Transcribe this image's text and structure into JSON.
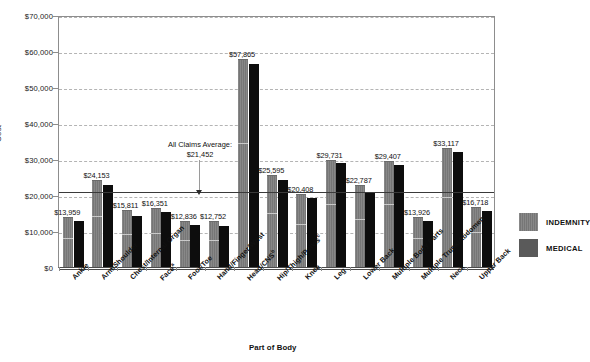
{
  "chart_data": {
    "type": "bar",
    "title": "",
    "xlabel": "Part of Body",
    "ylabel": "Cost",
    "ylim": [
      0,
      70000
    ],
    "ytick_labels": [
      "$0",
      "$10,000",
      "$20,000",
      "$30,000",
      "$40,000",
      "$50,000",
      "$60,000",
      "$70,000"
    ],
    "ytick_values": [
      0,
      10000,
      20000,
      30000,
      40000,
      50000,
      60000,
      70000
    ],
    "grid": "horizontal-dashed",
    "legend_position": "right",
    "categories": [
      "Ankle",
      "Arm/Shoulder",
      "Chest/Internal Organ",
      "Face",
      "Foot/Toe",
      "Hand/Finger/Wrist",
      "Head/CNS",
      "Hip/Thigh/Pelvis",
      "Knee",
      "Leg",
      "Lower Back",
      "Multiple Body Parts",
      "Multiple Trunk/Abdomen",
      "Neck",
      "Upper Back"
    ],
    "category_footnotes": [
      "",
      "",
      "",
      "a",
      "",
      "",
      "b",
      "c",
      "",
      "",
      "",
      "",
      "",
      "",
      ""
    ],
    "series": [
      {
        "name": "INDEMNITY",
        "color": "#767676",
        "values": [
          13959,
          24153,
          15811,
          16351,
          12836,
          12752,
          57865,
          25595,
          20408,
          29731,
          22787,
          29407,
          13926,
          33117,
          16718
        ]
      },
      {
        "name": "MEDICAL",
        "color": "#0d0d0d",
        "values": [
          12700,
          22750,
          14200,
          15200,
          11800,
          11300,
          56350,
          24100,
          19200,
          28850,
          20750,
          28200,
          12750,
          31900,
          15450
        ]
      }
    ],
    "data_labels": [
      "$13,959",
      "$24,153",
      "$15,811",
      "$16,351",
      "$12,836",
      "$12,752",
      "$57,865",
      "$25,595",
      "$20,408",
      "$29,731",
      "$22,787",
      "$29,407",
      "$13,926",
      "$33,117",
      "$16,718"
    ],
    "reference_line": {
      "label": "All Claims Average:",
      "value_label": "$21,452",
      "value": 21452
    }
  },
  "legend": {
    "items": [
      {
        "label": "INDEMNITY",
        "color": "#767676"
      },
      {
        "label": "MEDICAL",
        "color": "#5a5a5a"
      }
    ]
  }
}
